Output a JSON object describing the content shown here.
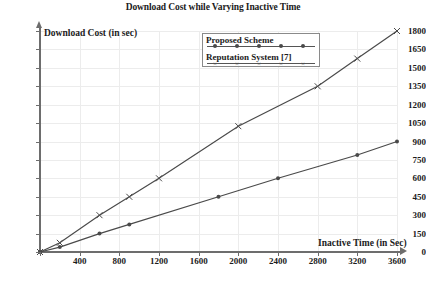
{
  "chart_data": {
    "type": "line",
    "title": "Download Cost while Varying Inactive Time",
    "xlabel": "Inactive Time (in Sec)",
    "ylabel": "Download Cost (in sec)",
    "xlim": [
      0,
      3600
    ],
    "ylim": [
      0,
      1800
    ],
    "xticks": [
      0,
      400,
      800,
      1200,
      1600,
      2000,
      2400,
      2800,
      3200,
      3600
    ],
    "yticks": [
      0,
      150,
      300,
      450,
      600,
      750,
      900,
      1050,
      1200,
      1350,
      1500,
      1650,
      1800
    ],
    "grid": true,
    "legend_position": "top-center",
    "series": [
      {
        "name": "Proposed Scheme",
        "marker": "dot",
        "color": "#4a4a4a",
        "x": [
          0,
          200,
          600,
          900,
          1800,
          2400,
          3200,
          3600
        ],
        "values": [
          0,
          40,
          150,
          225,
          450,
          600,
          790,
          900
        ]
      },
      {
        "name": "Reputation System [7]",
        "marker": "x",
        "color": "#4a4a4a",
        "x": [
          0,
          200,
          600,
          900,
          1200,
          2000,
          2800,
          3200,
          3600
        ],
        "values": [
          0,
          75,
          300,
          450,
          600,
          1025,
          1350,
          1575,
          1800
        ]
      }
    ]
  },
  "axis": {
    "x_tick_labels": [
      "",
      "400",
      "800",
      "1200",
      "1600",
      "2000",
      "2400",
      "2800",
      "3200",
      "3600"
    ],
    "y_tick_labels": [
      "0",
      "150",
      "300",
      "450",
      "600",
      "750",
      "900",
      "1050",
      "1200",
      "1350",
      "1500",
      "1650",
      "1800"
    ]
  },
  "legend": {
    "entries": [
      {
        "label": "Proposed Scheme"
      },
      {
        "label": "Reputation System [7]"
      }
    ]
  },
  "colors": {
    "axis": "#6d6d6d",
    "grid": "#ececec",
    "series": "#4a4a4a",
    "text": "#1b1b1b",
    "background": "#ffffff"
  }
}
